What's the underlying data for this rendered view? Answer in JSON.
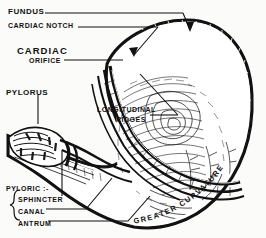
{
  "figure": {
    "background_color": "#fbfbfa",
    "ink_color": "#111111"
  },
  "labels": {
    "fundus": "FUNDUS",
    "cardiac_notch": "CARDIAC NOTCH",
    "cardiac": "CARDIAC",
    "orifice": "ORIFICE",
    "pylorus": "PYLORUS",
    "longitudinal": "LONGITUDINAL",
    "ridges": "RIDGES",
    "pyloric": "PYLORIC :-",
    "sphincter": "SPHINCTER",
    "canal": "CANAL",
    "antrum": "ANTRUM",
    "greater_curvature": "GREATER  CURVATURE"
  }
}
